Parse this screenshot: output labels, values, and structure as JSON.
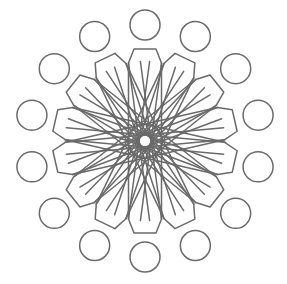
{
  "figure": {
    "width": 287,
    "height": 284,
    "background": "#ffffff",
    "stroke_color": "#6a6a6a",
    "stroke_width": 1.5,
    "center": [
      145,
      141
    ],
    "symmetry": 14,
    "outer_circles": {
      "count": 14,
      "ring_radius": 116,
      "circle_radius": 15,
      "start_angle_deg": -90
    },
    "petals": {
      "count": 14,
      "tip_radius": 92,
      "tip_half_width": 11,
      "shoulder_radius": 78,
      "shoulder_half_width": 16.5,
      "start_angle_deg": -90
    },
    "center_hole_radius": 6
  }
}
